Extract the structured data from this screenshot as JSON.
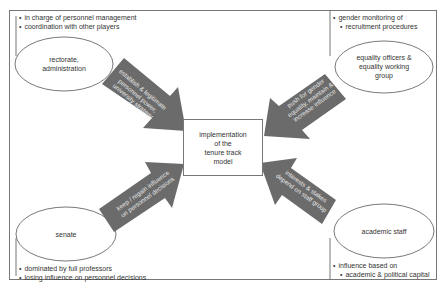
{
  "center": {
    "label_lines": [
      "implementation",
      "of the",
      "tenure track",
      "model"
    ]
  },
  "actors": [
    {
      "id": "rectorate",
      "label_lines": [
        "rectorate,",
        "administration"
      ],
      "notes": [
        "in charge of personnel management",
        "coordination with other players"
      ],
      "arrow_text_lines": [
        "establish & legitimate",
        "personnel power,",
        "university strategy"
      ]
    },
    {
      "id": "equality",
      "label_lines": [
        "equality officers &",
        "equality working",
        "group"
      ],
      "notes": [
        "gender monitoring of",
        "recruitment procedures"
      ],
      "arrow_text_lines": [
        "push for gender",
        "equality, maintain &",
        "increase influence"
      ]
    },
    {
      "id": "senate",
      "label_lines": [
        "senate"
      ],
      "notes": [
        "dominated by full professors",
        "losing influence on personnel decisions"
      ],
      "arrow_text_lines": [
        "keep / regain influence",
        "on personnel decisions"
      ]
    },
    {
      "id": "academic-staff",
      "label_lines": [
        "academic staff"
      ],
      "notes": [
        "influence based on",
        "academic & political capital"
      ],
      "arrow_text_lines": [
        "interests & stakes",
        "depend on staff group"
      ]
    }
  ],
  "colors": {
    "arrow_fill": "#6b6b6b",
    "line": "#777777",
    "text": "#333333"
  }
}
